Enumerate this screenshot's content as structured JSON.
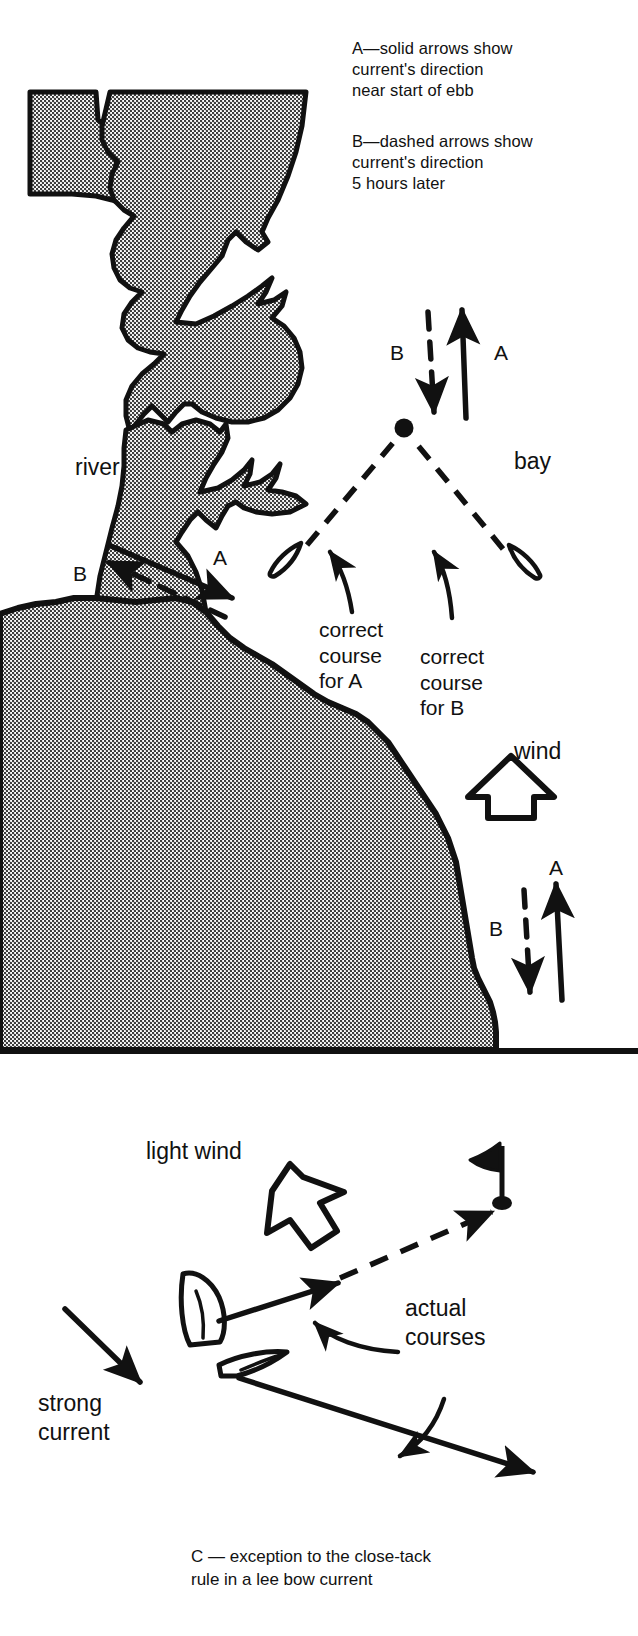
{
  "legend": {
    "entry_a": "A—solid arrows show\ncurrent's direction\nnear start of ebb",
    "entry_b": "B—dashed arrows show\ncurrent's direction\n5 hours later"
  },
  "scene_top": {
    "river_label": "river",
    "bay_label": "bay",
    "arrow_a_label_bay": "A",
    "arrow_b_label_bay": "B",
    "arrow_a_label_river": "A",
    "arrow_b_label_river": "B",
    "course_a_note": "correct\ncourse\nfor A",
    "course_b_note": "correct\ncourse\nfor B"
  },
  "scene_mid": {
    "wind_label": "wind",
    "arrow_a_label": "A",
    "arrow_b_label": "B"
  },
  "scene_bottom": {
    "light_wind_label": "light wind",
    "strong_current_label": "strong\ncurrent",
    "actual_courses_label": "actual\ncourses"
  },
  "caption": "C — exception to the close-tack\nrule in a lee bow current",
  "colors": {
    "ink": "#111111",
    "land_fill": "#9a9a9a",
    "paper": "#ffffff"
  }
}
